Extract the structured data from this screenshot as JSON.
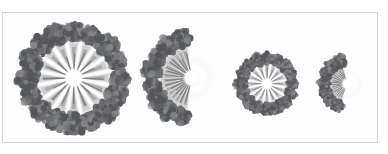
{
  "figure": {
    "domain_kind": "micrograph-figure",
    "panel": {
      "background_color": "#fefefe",
      "border_color": "#d8d8d8",
      "page_background": "#ffffff",
      "x": 2,
      "y": 12,
      "width": 376,
      "height": 131
    },
    "palette": {
      "blob_dark": "#55565a",
      "blob_mid": "#6b6c70",
      "blob_light": "#85868a",
      "spoke_light": "#d9d9d9",
      "spoke_mid": "#b9b9b9",
      "spoke_dark": "#8e8e90",
      "hub_bright": "#ffffff",
      "hub_halo": "#ededed",
      "background": "#fdfdfd"
    },
    "structures": [
      {
        "name": "large-full-assembly",
        "view": "full",
        "center_x": 70,
        "center_y": 66,
        "ring_radius": 47,
        "blob_count": 16,
        "blob_radius": 11,
        "spoke_count": 16,
        "spoke_inner": 10,
        "spoke_outer": 39,
        "hub_radius": 11,
        "angle_start": 0,
        "angle_span": 360
      },
      {
        "name": "large-cutaway-assembly",
        "view": "half",
        "center_x": 190,
        "center_y": 66,
        "ring_radius": 41,
        "blob_count": 16,
        "blob_radius": 10,
        "spoke_count": 16,
        "spoke_inner": 9,
        "spoke_outer": 35,
        "hub_radius": 10,
        "angle_start": 105,
        "angle_span": 150
      },
      {
        "name": "small-full-assembly",
        "view": "full",
        "center_x": 266,
        "center_y": 72,
        "ring_radius": 26,
        "blob_count": 16,
        "blob_radius": 7,
        "spoke_count": 16,
        "spoke_inner": 6,
        "spoke_outer": 21,
        "hub_radius": 7,
        "angle_start": 0,
        "angle_span": 360
      },
      {
        "name": "small-cutaway-assembly",
        "view": "half",
        "center_x": 348,
        "center_y": 72,
        "ring_radius": 24,
        "blob_count": 16,
        "blob_radius": 7,
        "spoke_count": 16,
        "spoke_inner": 6,
        "spoke_outer": 20,
        "hub_radius": 7,
        "angle_start": 115,
        "angle_span": 135
      }
    ]
  }
}
